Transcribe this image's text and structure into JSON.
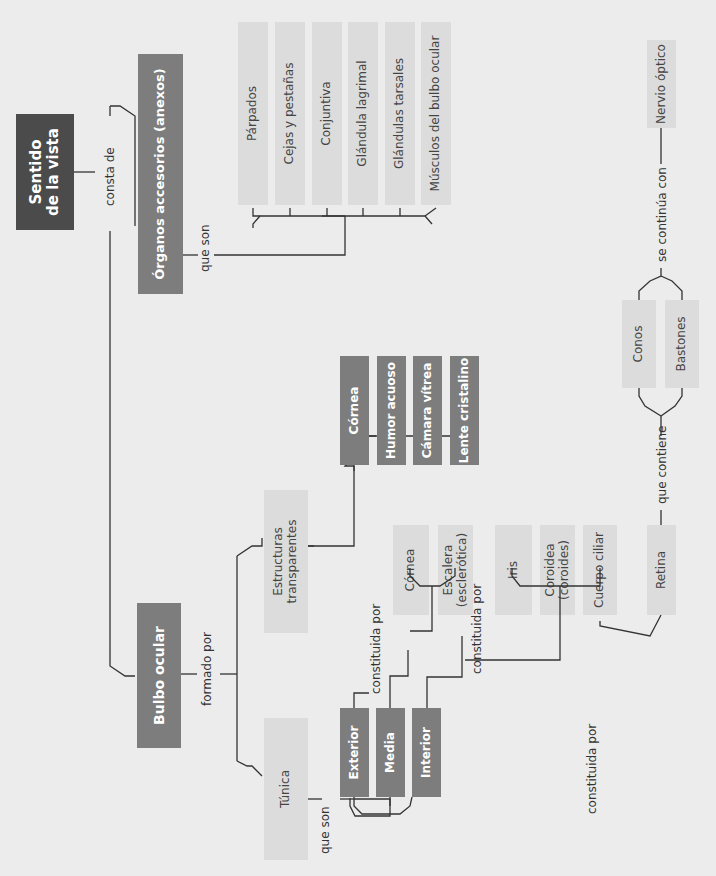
{
  "title": "Sentido de la vista",
  "colors": {
    "dark_box": "#4b4b4b",
    "mid_box": "#7d7d7d",
    "light_box": "#dcdcdc",
    "line": "#333333",
    "background": "#ececec"
  },
  "root": {
    "label": "Sentido\nde la vista",
    "connector": "consta de"
  },
  "accessory": {
    "label": "Órganos accesorios (anexos)",
    "connector": "que son",
    "items": [
      "Párpados",
      "Cejas y pestañas",
      "Conjuntiva",
      "Glándula lagrimal",
      "Glándulas tarsales",
      "Músculos del bulbo ocular"
    ]
  },
  "bulb": {
    "label": "Bulbo ocular",
    "connector": "formado por",
    "transparent": {
      "label": "Estructuras transparentes",
      "items": [
        "Córnea",
        "Humor acuoso",
        "Cámara vítrea",
        "Lente cristalino"
      ]
    },
    "tunic": {
      "label": "Túnica",
      "connector": "que son",
      "layers": [
        {
          "label": "Exterior",
          "connector": "constituida por",
          "items": [
            "Córnea",
            "Escalera (esclerótica)"
          ]
        },
        {
          "label": "Media",
          "connector": "constituida por",
          "items": [
            "Iris",
            "Coroidea (coroides)",
            "Cuerpo ciliar"
          ]
        },
        {
          "label": "Interior",
          "connector": "constituida por",
          "items": [
            "Retina"
          ]
        }
      ]
    },
    "retina": {
      "connector": "que contiene",
      "items": [
        "Conos",
        "Bastones"
      ],
      "continues_connector": "se continúa con",
      "continues_to": "Nervio óptico"
    }
  }
}
